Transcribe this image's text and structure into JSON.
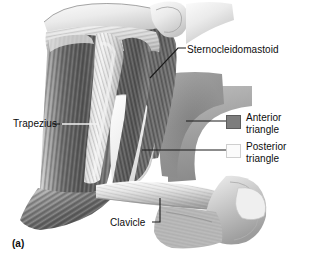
{
  "figure": {
    "caption": "(a)",
    "background_color": "#ffffff",
    "text_color": "#0d0d0d"
  },
  "labels": {
    "sternocleidomastoid": "Sternocleidomastoid",
    "trapezius": "Trapezius",
    "clavicle": "Clavicle"
  },
  "legend": {
    "items": [
      {
        "label_line1": "Anterior",
        "label_line2": "triangle",
        "swatch_color": "#7d7d7d",
        "swatch_border": "#5c5c5c"
      },
      {
        "label_line1": "Posterior",
        "label_line2": "triangle",
        "swatch_color": "#fbfbfb",
        "swatch_border": "#cfcfcf"
      }
    ]
  },
  "illustration": {
    "subject": "lateral-neck-muscles",
    "style": "grayscale-medical-drawing",
    "structures": [
      "trapezius",
      "sternocleidomastoid",
      "clavicle",
      "mandible",
      "anterior-triangle",
      "posterior-triangle",
      "shoulder"
    ],
    "palette": {
      "muscle_dark": "#4a4a4a",
      "muscle_mid": "#7a7a7a",
      "muscle_light": "#c8c8c8",
      "skin_light": "#ededed",
      "bone_light": "#e4e4e4",
      "anterior_triangle_fill": "#8f8f8f",
      "posterior_triangle_fill": "#f2f2f2",
      "outline": "#3a3a3a"
    }
  }
}
